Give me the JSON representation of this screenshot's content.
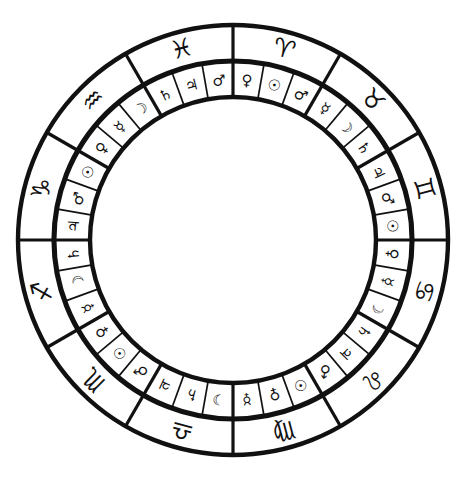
{
  "figure": {
    "orientation": "Aries at top, signs run clockwise",
    "colors": {
      "background": "#ffffff",
      "ink": "#111111"
    },
    "geometry": {
      "center_x": 233,
      "center_y": 240,
      "radius_outer": 215,
      "radius_sign_inner": 180,
      "radius_decan_outer": 178,
      "radius_decan_inner": 143,
      "sign_glyph_radius": 198,
      "decan_glyph_radius": 160,
      "sector_count": 12,
      "decan_count": 36,
      "degrees_per_sign": 30,
      "degrees_per_decan": 10
    }
  },
  "chart_data": {
    "type": "pie",
    "legend_position": "none",
    "grid": false,
    "categories": [
      "Aries",
      "Taurus",
      "Gemini",
      "Cancer",
      "Leo",
      "Virgo",
      "Libra",
      "Scorpio",
      "Sagittarius",
      "Capricorn",
      "Aquarius",
      "Pisces"
    ],
    "values": [
      30,
      30,
      30,
      30,
      30,
      30,
      30,
      30,
      30,
      30,
      30,
      30
    ],
    "signs": [
      {
        "name": "Aries",
        "glyph": "♈",
        "start_degree": 0,
        "decans": [
          {
            "ruler": "Venus",
            "glyph": "♀"
          },
          {
            "ruler": "Sun",
            "glyph": "☉"
          },
          {
            "ruler": "Mars",
            "glyph": "♂"
          }
        ]
      },
      {
        "name": "Taurus",
        "glyph": "♉",
        "start_degree": 30,
        "decans": [
          {
            "ruler": "Mercury",
            "glyph": "☿"
          },
          {
            "ruler": "Moon",
            "glyph": "☽"
          },
          {
            "ruler": "Saturn",
            "glyph": "♄"
          }
        ]
      },
      {
        "name": "Gemini",
        "glyph": "♊",
        "start_degree": 60,
        "decans": [
          {
            "ruler": "Jupiter",
            "glyph": "♃"
          },
          {
            "ruler": "Mars",
            "glyph": "♂"
          },
          {
            "ruler": "Sun",
            "glyph": "☉"
          }
        ]
      },
      {
        "name": "Cancer",
        "glyph": "♋",
        "start_degree": 90,
        "decans": [
          {
            "ruler": "Venus",
            "glyph": "♀"
          },
          {
            "ruler": "Mercury",
            "glyph": "☿"
          },
          {
            "ruler": "Moon",
            "glyph": "☽"
          }
        ]
      },
      {
        "name": "Leo",
        "glyph": "♌",
        "start_degree": 120,
        "decans": [
          {
            "ruler": "Saturn",
            "glyph": "♄"
          },
          {
            "ruler": "Jupiter",
            "glyph": "♃"
          },
          {
            "ruler": "Mars",
            "glyph": "♂"
          }
        ]
      },
      {
        "name": "Virgo",
        "glyph": "♍",
        "start_degree": 150,
        "decans": [
          {
            "ruler": "Sun",
            "glyph": "☉"
          },
          {
            "ruler": "Venus",
            "glyph": "♀"
          },
          {
            "ruler": "Mercury",
            "glyph": "☿"
          }
        ]
      },
      {
        "name": "Libra",
        "glyph": "♎",
        "start_degree": 180,
        "decans": [
          {
            "ruler": "Moon",
            "glyph": "☽"
          },
          {
            "ruler": "Saturn",
            "glyph": "♄"
          },
          {
            "ruler": "Jupiter",
            "glyph": "♃"
          }
        ]
      },
      {
        "name": "Scorpio",
        "glyph": "♏",
        "start_degree": 210,
        "decans": [
          {
            "ruler": "Mars",
            "glyph": "♂"
          },
          {
            "ruler": "Sun",
            "glyph": "☉"
          },
          {
            "ruler": "Venus",
            "glyph": "♀"
          }
        ]
      },
      {
        "name": "Sagittarius",
        "glyph": "♐",
        "start_degree": 240,
        "decans": [
          {
            "ruler": "Mercury",
            "glyph": "☿"
          },
          {
            "ruler": "Moon",
            "glyph": "☽"
          },
          {
            "ruler": "Saturn",
            "glyph": "♄"
          }
        ]
      },
      {
        "name": "Capricorn",
        "glyph": "♑",
        "start_degree": 270,
        "decans": [
          {
            "ruler": "Jupiter",
            "glyph": "♃"
          },
          {
            "ruler": "Mars",
            "glyph": "♂"
          },
          {
            "ruler": "Sun",
            "glyph": "☉"
          }
        ]
      },
      {
        "name": "Aquarius",
        "glyph": "♒",
        "start_degree": 300,
        "decans": [
          {
            "ruler": "Venus",
            "glyph": "♀"
          },
          {
            "ruler": "Mercury",
            "glyph": "☿"
          },
          {
            "ruler": "Moon",
            "glyph": "☽"
          }
        ]
      },
      {
        "name": "Pisces",
        "glyph": "♓",
        "start_degree": 330,
        "decans": [
          {
            "ruler": "Saturn",
            "glyph": "♄"
          },
          {
            "ruler": "Jupiter",
            "glyph": "♃"
          },
          {
            "ruler": "Mars",
            "glyph": "♂"
          }
        ]
      }
    ]
  }
}
